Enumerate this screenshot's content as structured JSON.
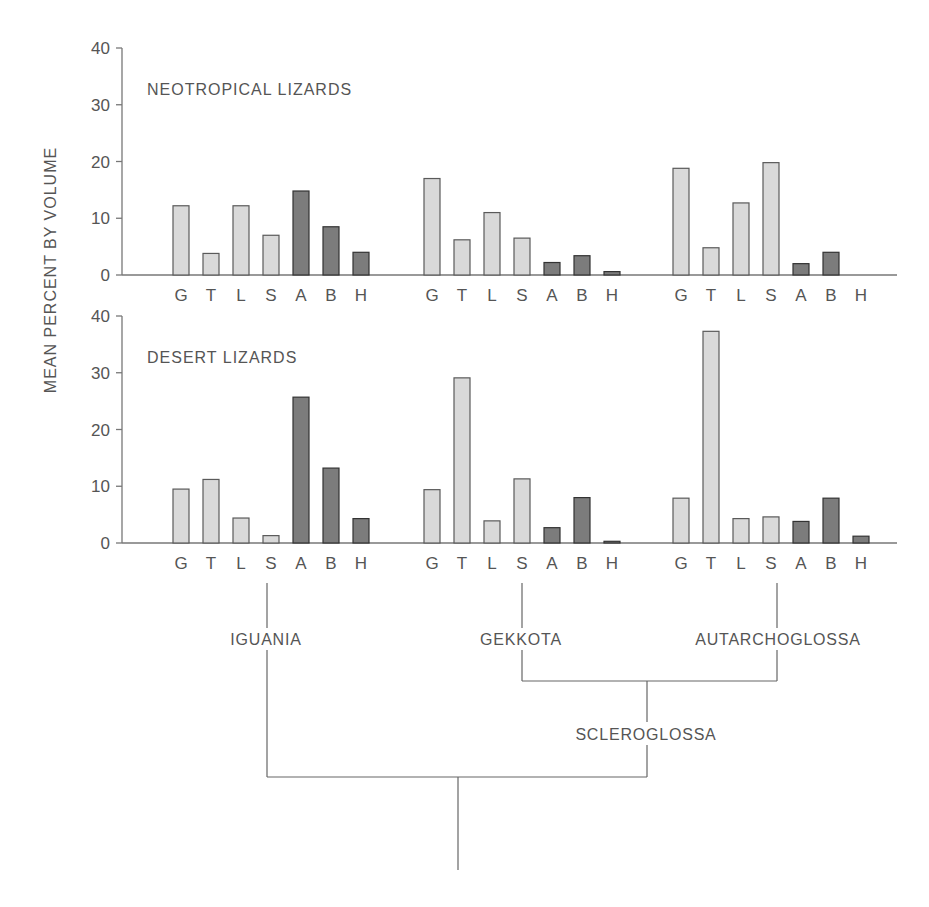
{
  "chart_data": [
    {
      "type": "bar",
      "title": "NEOTROPICAL LIZARDS",
      "ylabel": "MEAN PERCENT BY VOLUME",
      "ylim": [
        0,
        40
      ],
      "yticks": [
        0,
        10,
        20,
        30,
        40
      ],
      "categories": [
        "G",
        "T",
        "L",
        "S",
        "A",
        "B",
        "H"
      ],
      "groups": [
        "IGUANIA",
        "GEKKOTA",
        "AUTARCHOGLOSSA"
      ],
      "series": [
        {
          "name": "IGUANIA",
          "values": [
            12.2,
            3.8,
            12.2,
            7.0,
            14.8,
            8.5,
            4.0
          ]
        },
        {
          "name": "GEKKOTA",
          "values": [
            17.0,
            6.2,
            11.0,
            6.5,
            2.2,
            3.4,
            0.6
          ]
        },
        {
          "name": "AUTARCHOGLOSSA",
          "values": [
            18.8,
            4.8,
            12.7,
            19.8,
            2.0,
            4.0,
            0.0
          ]
        }
      ],
      "shading": {
        "light": [
          "G",
          "T",
          "L",
          "S"
        ],
        "dark": [
          "A",
          "B",
          "H"
        ]
      },
      "grid": false
    },
    {
      "type": "bar",
      "title": "DESERT LIZARDS",
      "ylabel": "MEAN PERCENT BY VOLUME",
      "ylim": [
        0,
        40
      ],
      "yticks": [
        0,
        10,
        20,
        30,
        40
      ],
      "categories": [
        "G",
        "T",
        "L",
        "S",
        "A",
        "B",
        "H"
      ],
      "groups": [
        "IGUANIA",
        "GEKKOTA",
        "AUTARCHOGLOSSA"
      ],
      "series": [
        {
          "name": "IGUANIA",
          "values": [
            9.5,
            11.2,
            4.4,
            1.3,
            25.7,
            13.2,
            4.3
          ]
        },
        {
          "name": "GEKKOTA",
          "values": [
            9.4,
            29.1,
            3.9,
            11.3,
            2.7,
            8.0,
            0.3
          ]
        },
        {
          "name": "AUTARCHOGLOSSA",
          "values": [
            7.9,
            37.3,
            4.3,
            4.6,
            3.8,
            7.9,
            1.2
          ]
        }
      ],
      "shading": {
        "light": [
          "G",
          "T",
          "L",
          "S"
        ],
        "dark": [
          "A",
          "B",
          "H"
        ]
      },
      "grid": false
    }
  ],
  "axis": {
    "title": "MEAN PERCENT BY VOLUME",
    "tick_labels": [
      "0",
      "10",
      "20",
      "30",
      "40"
    ]
  },
  "panels": {
    "top_title": "NEOTROPICAL LIZARDS",
    "bottom_title": "DESERT LIZARDS"
  },
  "phylogeny": {
    "tips": [
      "IGUANIA",
      "GEKKOTA",
      "AUTARCHOGLOSSA"
    ],
    "internal_node": "SCLEROGLOSSA"
  },
  "colors": {
    "light_fill": "#d9d9d9",
    "light_stroke": "#5a5a5a",
    "dark_fill": "#7c7c7c",
    "dark_stroke": "#333333",
    "axis": "#777777",
    "text": "#555555"
  }
}
